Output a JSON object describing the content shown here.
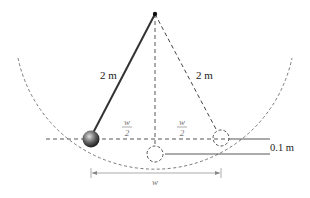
{
  "diagram": {
    "type": "pendulum",
    "labels": {
      "left_string": "2 m",
      "right_string": "2 m",
      "half_width_left_num": "w",
      "half_width_left_den": "2",
      "half_width_right_num": "w",
      "half_width_right_den": "2",
      "height_diff": "0.1 m",
      "total_width": "w"
    },
    "colors": {
      "string": "#333333",
      "dashed": "#444444",
      "bob_dark": "#222222",
      "bob_light": "#bbbbbb",
      "dimension": "#888888"
    }
  }
}
